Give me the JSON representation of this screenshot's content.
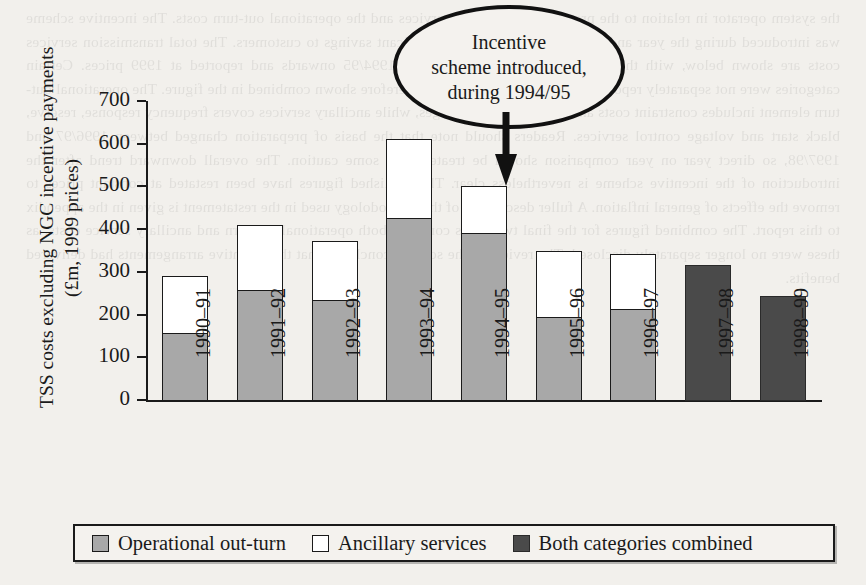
{
  "chart_data": {
    "type": "bar",
    "subtype": "stacked",
    "title": "",
    "xlabel": "",
    "ylabel": "TSS costs excluding NGC incentive payments (£m, 1999 prices)",
    "ylabel_line1": "TSS costs excluding NGC incentive payments",
    "ylabel_line2": "(£m, 1999 prices)",
    "ylim": [
      0,
      700
    ],
    "ytick_values": [
      0,
      100,
      200,
      300,
      400,
      500,
      600,
      700
    ],
    "ytick_labels": [
      "0",
      "100",
      "200",
      "300",
      "400",
      "500",
      "600",
      "700"
    ],
    "grid": false,
    "legend_position": "bottom",
    "categories": [
      "1990–91",
      "1991–92",
      "1992–93",
      "1993–94",
      "1994–95",
      "1995–96",
      "1996–97",
      "1997–98",
      "1998–99"
    ],
    "series": [
      {
        "name": "Operational out-turn",
        "color": "#a8a8a8",
        "values": [
          160,
          260,
          238,
          430,
          395,
          198,
          215,
          null,
          null
        ]
      },
      {
        "name": "Ancillary services",
        "color": "#ffffff",
        "values": [
          137,
          155,
          140,
          187,
          113,
          157,
          132,
          null,
          null
        ]
      },
      {
        "name": "Both categories combined",
        "color": "#4a4a4a",
        "values": [
          null,
          null,
          null,
          null,
          null,
          null,
          null,
          320,
          247
        ]
      }
    ],
    "totals": [
      297,
      415,
      378,
      617,
      508,
      355,
      347,
      320,
      247
    ],
    "annotations": [
      {
        "text": "Incentive scheme introduced, during 1994/95",
        "lines": [
          "Incentive",
          "scheme introduced,",
          "during 1994/95"
        ],
        "shape": "ellipse",
        "points_to": "1994–95"
      }
    ]
  },
  "legend": {
    "items": [
      {
        "label": "Operational out-turn",
        "swatch": "swatch-operational"
      },
      {
        "label": "Ancillary services",
        "swatch": "swatch-ancillary"
      },
      {
        "label": "Both categories combined",
        "swatch": "swatch-combined"
      }
    ]
  },
  "colors": {
    "operational": "#a8a8a8",
    "ancillary": "#ffffff",
    "combined": "#4a4a4a",
    "axis": "#1a1a1a",
    "page_background": "#f2f0ec"
  },
  "ghost_text": "scanned page bleed-through"
}
